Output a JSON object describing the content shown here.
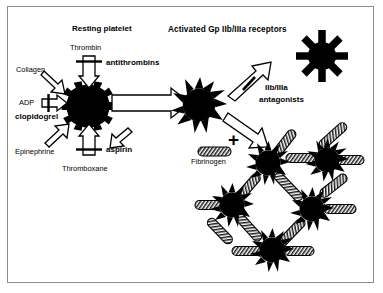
{
  "figure": {
    "title_resting": "Resting platelet",
    "title_activated": "Activated Gp IIb/IIIa receptors",
    "border_color": "#8d8d8d",
    "ink_color": "#000000",
    "background": "#ffffff"
  },
  "agonists": [
    {
      "name": "collagen",
      "label": "Collagen",
      "weight": "regular",
      "blocked": false
    },
    {
      "name": "adp",
      "label": "ADP",
      "weight": "regular",
      "blocked": true
    },
    {
      "name": "epinephrine",
      "label": "Epinephrine",
      "weight": "regular",
      "blocked": false
    },
    {
      "name": "thromboxane",
      "label": "Thromboxane",
      "weight": "regular",
      "blocked": true
    },
    {
      "name": "thrombin",
      "label": "Thrombin",
      "weight": "regular",
      "blocked": true
    }
  ],
  "inhibitors": [
    {
      "name": "antithrombins",
      "label": "antithrombins",
      "blocks": "thrombin"
    },
    {
      "name": "clopidogrel",
      "label": "clopidogrel",
      "blocks": "adp"
    },
    {
      "name": "aspirin",
      "label": "aspirin",
      "blocks": "thromboxane"
    },
    {
      "name": "gp-antagonists",
      "label_line1": "IIb/IIIa",
      "label_line2": "antagonists",
      "blocks": "gp-receptor-expression"
    }
  ],
  "molecules": {
    "fibrinogen_label": "Fibrinogen",
    "plus_symbol": "+"
  },
  "icons": {
    "resting_platelet": "cog-platelet-icon",
    "activated_platelet": "spiky-platelet-icon",
    "receptor_platelet": "receptor-arms-platelet-icon",
    "fibrinogen": "hatched-rod-icon",
    "activation_arrow": "hollow-block-arrow-icon",
    "inhibitor_bar": "blocking-bar-icon"
  },
  "aggregate": {
    "name": "platelet-aggregate",
    "platelet_count": 5,
    "linked_by": "Fibrinogen"
  }
}
